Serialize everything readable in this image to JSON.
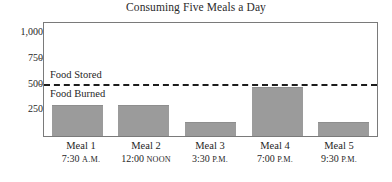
{
  "chart_data": {
    "type": "bar",
    "title": "Consuming Five Meals a Day",
    "xlabel": "",
    "ylabel": "",
    "ylim": [
      0,
      1100
    ],
    "grid": false,
    "legend_position": "inline-annotations",
    "categories": [
      "Meal 1",
      "Meal 2",
      "Meal 3",
      "Meal 4",
      "Meal 5"
    ],
    "category_sublabels": [
      "7:30 A.M.",
      "12:00 NOON",
      "3:30 P.M.",
      "7:00 P.M.",
      "9:30 P.M."
    ],
    "values": [
      300,
      300,
      135,
      475,
      140
    ],
    "ytick_labels": [
      "1,000",
      "750",
      "500",
      "250"
    ],
    "ytick_values": [
      1000,
      750,
      500,
      250
    ],
    "annotations": [
      {
        "text": "Food Stored",
        "position": "above-threshold-line"
      },
      {
        "text": "Food Burned",
        "position": "below-threshold-line"
      }
    ],
    "threshold_line": {
      "value": 505,
      "style": "dashed",
      "color": "#1c1c1c",
      "label_above": "Food Stored",
      "label_below": "Food Burned"
    },
    "colors": {
      "bar_fill": "#9b9b9b",
      "frame": "#7a7a7a",
      "text": "#1f1f1f",
      "threshold": "#1c1c1c"
    }
  },
  "title": {
    "text": "Consuming Five Meals a Day"
  },
  "y_axis": {
    "ticks": [
      {
        "label": "1,000",
        "value": 1000
      },
      {
        "label": "750",
        "value": 750
      },
      {
        "label": "500",
        "value": 500
      },
      {
        "label": "250",
        "value": 250
      }
    ]
  },
  "bands": {
    "stored_label": "Food Stored",
    "burned_label": "Food Burned"
  },
  "x_axis": {
    "groups": [
      {
        "name": "Meal 1",
        "time_value": "7:30",
        "time_suffix": "A.M."
      },
      {
        "name": "Meal 2",
        "time_value": "12:00",
        "time_suffix": "NOON"
      },
      {
        "name": "Meal 3",
        "time_value": "3:30",
        "time_suffix": "P.M."
      },
      {
        "name": "Meal 4",
        "time_value": "7:00",
        "time_suffix": "P.M."
      },
      {
        "name": "Meal 5",
        "time_value": "9:30",
        "time_suffix": "P.M."
      }
    ]
  }
}
